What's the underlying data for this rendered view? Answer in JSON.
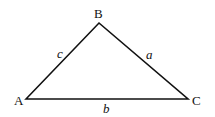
{
  "diagram": {
    "type": "triangle",
    "vertices": [
      {
        "label": "A",
        "x": 26,
        "y": 99
      },
      {
        "label": "B",
        "x": 99,
        "y": 23
      },
      {
        "label": "C",
        "x": 188,
        "y": 99
      }
    ],
    "sides": [
      {
        "label": "c",
        "from": "A",
        "to": "B"
      },
      {
        "label": "a",
        "from": "B",
        "to": "C"
      },
      {
        "label": "b",
        "from": "A",
        "to": "C"
      }
    ],
    "stroke_color": "#111111"
  }
}
